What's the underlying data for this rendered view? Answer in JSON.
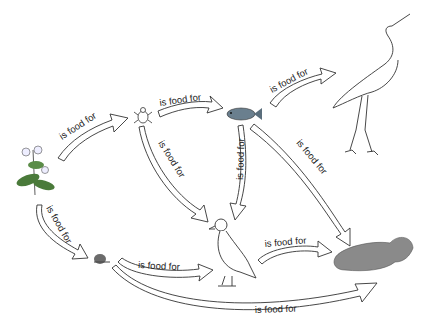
{
  "diagram": {
    "type": "food-web",
    "organisms": [
      {
        "id": "plant",
        "name": "plant"
      },
      {
        "id": "insect",
        "name": "insect"
      },
      {
        "id": "fish",
        "name": "fish"
      },
      {
        "id": "heron",
        "name": "heron"
      },
      {
        "id": "snail",
        "name": "snail"
      },
      {
        "id": "duck",
        "name": "duck"
      },
      {
        "id": "otter",
        "name": "otter"
      }
    ],
    "links": [
      {
        "from": "plant",
        "to": "insect",
        "label": "is food for"
      },
      {
        "from": "insect",
        "to": "fish",
        "label": "is food for"
      },
      {
        "from": "fish",
        "to": "heron",
        "label": "is food for"
      },
      {
        "from": "insect",
        "to": "duck",
        "label": "is food for"
      },
      {
        "from": "fish",
        "to": "duck",
        "label": "is food for"
      },
      {
        "from": "fish",
        "to": "otter",
        "label": "is food for"
      },
      {
        "from": "plant",
        "to": "snail",
        "label": "is food for"
      },
      {
        "from": "snail",
        "to": "duck",
        "label": "is food for"
      },
      {
        "from": "duck",
        "to": "otter",
        "label": "is food for"
      },
      {
        "from": "snail",
        "to": "otter",
        "label": "is food for"
      }
    ]
  }
}
